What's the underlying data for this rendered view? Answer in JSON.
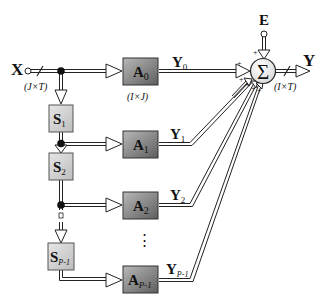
{
  "input": {
    "label": "X",
    "dims": "(J×T)"
  },
  "noise": {
    "label": "E"
  },
  "output": {
    "label": "Y",
    "dims": "(I×T)"
  },
  "sum": {
    "symbol": "Σ",
    "signs": [
      "+",
      "+",
      "+",
      "+",
      "+",
      "+"
    ]
  },
  "a_dims": "(I×J)",
  "branches": [
    {
      "a": "A",
      "a_sub": "0",
      "y": "Y",
      "y_sub": "0"
    },
    {
      "a": "A",
      "a_sub": "1",
      "y": "Y",
      "y_sub": "1"
    },
    {
      "a": "A",
      "a_sub": "2",
      "y": "Y",
      "y_sub": "2"
    },
    {
      "a": "A",
      "a_sub": "P-1",
      "y": "Y",
      "y_sub": "P-1"
    }
  ],
  "shifts": [
    {
      "s": "S",
      "sub": "1"
    },
    {
      "s": "S",
      "sub": "2"
    },
    {
      "s": "S",
      "sub": "P-1"
    }
  ],
  "ellipsis": "⋮",
  "colors": {
    "a_block_dark": "#6e6e6e",
    "a_block_light": "#b4b4b4",
    "s_block": "#d2d2d2",
    "sum_fill": "#f0f0f0",
    "line": "#222222"
  }
}
